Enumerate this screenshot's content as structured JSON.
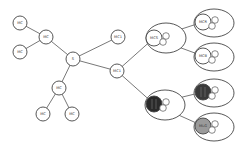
{
  "diagram": {
    "type": "hierarchical network / tree diagram",
    "colors": {
      "stroke": "#444444",
      "dark_fill": "#2a2a2a",
      "gray_fill": "#9a9a9a",
      "background": "#ffffff"
    },
    "nodes": [
      {
        "id": "n1",
        "label": "MC",
        "x": 20,
        "y": 23,
        "r": 7
      },
      {
        "id": "n2",
        "label": "MC",
        "x": 20,
        "y": 52,
        "r": 7
      },
      {
        "id": "n3",
        "label": "MC",
        "x": 46,
        "y": 37,
        "r": 7
      },
      {
        "id": "hub",
        "label": "S",
        "x": 73,
        "y": 59,
        "r": 7
      },
      {
        "id": "n4",
        "label": "MC1",
        "x": 118,
        "y": 37,
        "r": 7
      },
      {
        "id": "n5",
        "label": "MC",
        "x": 59,
        "y": 88,
        "r": 7
      },
      {
        "id": "n6",
        "label": "MC",
        "x": 43,
        "y": 114,
        "r": 7
      },
      {
        "id": "n7",
        "label": "MC",
        "x": 72,
        "y": 114,
        "r": 7
      },
      {
        "id": "n8",
        "label": "MC1",
        "x": 117,
        "y": 71,
        "r": 7
      }
    ],
    "groups": [
      {
        "id": "g1",
        "label": "MCS",
        "cx": 166,
        "cy": 38,
        "rx": 20,
        "ry": 15,
        "ix": 154,
        "iy": 38,
        "ir": 8,
        "fill": "#ffffff"
      },
      {
        "id": "g2",
        "label": "MCR",
        "cx": 214,
        "cy": 23,
        "rx": 20,
        "ry": 14,
        "ix": 203,
        "iy": 22,
        "ir": 8,
        "fill": "#ffffff"
      },
      {
        "id": "g3",
        "label": "MCB",
        "cx": 214,
        "cy": 57,
        "rx": 20,
        "ry": 14,
        "ix": 203,
        "iy": 56,
        "ir": 8,
        "fill": "#ffffff"
      },
      {
        "id": "g4",
        "label": "",
        "cx": 165,
        "cy": 105,
        "rx": 20,
        "ry": 15,
        "ix": 154,
        "iy": 104,
        "ir": 8,
        "fill": "#2a2a2a"
      },
      {
        "id": "g5",
        "label": "",
        "cx": 214,
        "cy": 93,
        "rx": 20,
        "ry": 14,
        "ix": 203,
        "iy": 92,
        "ir": 8,
        "fill": "#3a3a3a"
      },
      {
        "id": "g6",
        "label": "MLG",
        "cx": 214,
        "cy": 127,
        "rx": 20,
        "ry": 14,
        "ix": 203,
        "iy": 126,
        "ir": 8,
        "fill": "#9a9a9a"
      }
    ],
    "edges": [
      [
        "n1",
        "n3"
      ],
      [
        "n2",
        "n3"
      ],
      [
        "n3",
        "hub"
      ],
      [
        "hub",
        "n4"
      ],
      [
        "hub",
        "n5"
      ],
      [
        "hub",
        "n8"
      ],
      [
        "n5",
        "n6"
      ],
      [
        "n5",
        "n7"
      ],
      [
        "n8",
        "g1"
      ],
      [
        "n8",
        "g4"
      ],
      [
        "g1",
        "g2"
      ],
      [
        "g1",
        "g3"
      ],
      [
        "g4",
        "g5"
      ],
      [
        "g4",
        "g6"
      ]
    ]
  }
}
